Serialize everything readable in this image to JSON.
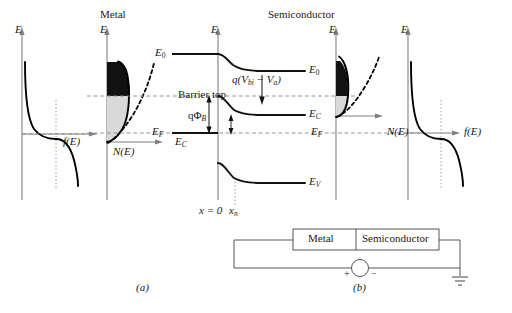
{
  "figure": {
    "titles": {
      "metal": "Metal",
      "semiconductor": "Semiconductor"
    },
    "captions": {
      "a": "(a)",
      "b": "(b)"
    }
  },
  "axes": {
    "energy_axis_label": "E",
    "occupancy_axis_label": "f(E)",
    "dos_axis_label": "N(E)",
    "panels": [
      {
        "name": "metal-fermi-function",
        "vertical": "E",
        "horizontal": "f(E)"
      },
      {
        "name": "metal-density-of-states",
        "vertical": "E",
        "horizontal": "N(E)"
      },
      {
        "name": "band-diagram",
        "vertical": "E",
        "horizontal": "x"
      },
      {
        "name": "semiconductor-density-of-states",
        "vertical": "E",
        "horizontal": "N(E)"
      },
      {
        "name": "semiconductor-fermi-function",
        "vertical": "E",
        "horizontal": "f(E)"
      }
    ]
  },
  "energy_levels": {
    "vacuum": "E",
    "vacuum_sub": "0",
    "fermi": "E",
    "fermi_sub": "F",
    "conduction": "E",
    "conduction_sub": "C",
    "valence": "E",
    "valence_sub": "V"
  },
  "annotations": {
    "barrier_top": "Barrier top",
    "barrier_height": "qΦ",
    "barrier_height_sub": "B",
    "built_in_potential_open": "q(V",
    "built_in_potential_sub1": "bi",
    "built_in_potential_mid": " − V",
    "built_in_potential_sub2": "a",
    "built_in_potential_close": ")",
    "origin": "x = 0",
    "depletion_edge": "x",
    "depletion_edge_sub": "n"
  },
  "circuit": {
    "metal_block": "Metal",
    "semiconductor_block": "Semiconductor",
    "source_plus": "+",
    "source_minus": "−",
    "ground_icon": "ground-symbol",
    "source_icon": "voltage-source-symbol"
  },
  "colors": {
    "ink": "#1a1a1a",
    "curve": "#000000",
    "axis": "#808080",
    "dash": "#8a8a8a",
    "fill_dark": "#000000",
    "fill_light": "#d9d9d9",
    "background": "#ffffff"
  }
}
